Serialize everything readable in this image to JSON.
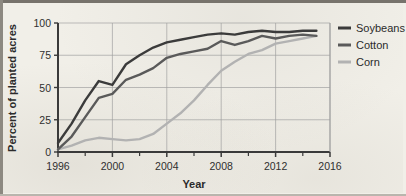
{
  "chart_data": {
    "type": "line",
    "title": "",
    "xlabel": "Year",
    "ylabel": "Percent of planted acres",
    "xlim": [
      1996,
      2016
    ],
    "ylim": [
      0,
      100
    ],
    "grid": true,
    "legend_position": "right",
    "x_ticks": [
      1996,
      2000,
      2004,
      2008,
      2012,
      2016
    ],
    "x_tick_labels": [
      "1996",
      "2000",
      "2004",
      "2008",
      "2012",
      "2016"
    ],
    "x_minor_tick_step": 2,
    "y_ticks": [
      0,
      25,
      50,
      75,
      100
    ],
    "y_tick_labels": [
      "0",
      "25",
      "50",
      "75",
      "100"
    ],
    "x": [
      1996,
      1997,
      1998,
      1999,
      2000,
      2001,
      2002,
      2003,
      2004,
      2005,
      2006,
      2007,
      2008,
      2009,
      2010,
      2011,
      2012,
      2013,
      2014,
      2015
    ],
    "series": [
      {
        "name": "Soybeans",
        "color": "#3b3b3b",
        "values": [
          7,
          22,
          40,
          55,
          52,
          68,
          75,
          81,
          85,
          87,
          89,
          91,
          92,
          91,
          93,
          94,
          93,
          93,
          94,
          94
        ]
      },
      {
        "name": "Cotton",
        "color": "#5a5a5a",
        "values": [
          2,
          12,
          27,
          42,
          45,
          56,
          60,
          65,
          73,
          76,
          78,
          80,
          86,
          83,
          86,
          90,
          88,
          90,
          91,
          90
        ]
      },
      {
        "name": "Corn",
        "color": "#b2b2b2",
        "values": [
          2,
          5,
          9,
          11,
          10,
          9,
          10,
          14,
          22,
          30,
          40,
          52,
          63,
          70,
          76,
          79,
          84,
          86,
          88,
          90
        ]
      }
    ]
  },
  "legend": {
    "entries": [
      {
        "label": "Soybeans",
        "color": "#3b3b3b"
      },
      {
        "label": "Cotton",
        "color": "#5a5a5a"
      },
      {
        "label": "Corn",
        "color": "#b2b2b2"
      }
    ]
  },
  "axes": {
    "y_title": "Percent of planted acres",
    "x_title": "Year"
  },
  "style": {
    "background": "#f1efe8",
    "grid_color": "#9f9f9f",
    "axis_color": "#3a3a3a",
    "text_color": "#2b2b2b"
  }
}
